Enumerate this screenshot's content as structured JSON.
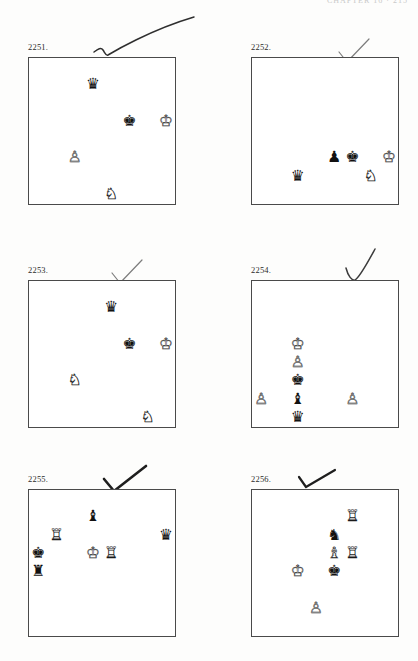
{
  "page": {
    "header_text": "CHAPTER 16  ·  215",
    "background_color": "#fdfdfc",
    "board_border_color": "#4a4a4a",
    "dark_square_color": "#8a8a8a",
    "light_square_color": "#ffffff"
  },
  "glyphs": {
    "white_king": "♔",
    "white_queen": "♕",
    "white_rook": "♖",
    "white_bishop": "♗",
    "white_knight": "♘",
    "white_pawn": "♙",
    "black_king": "♚",
    "black_queen": "♛",
    "black_rook": "♜",
    "black_bishop": "♝",
    "black_knight": "♞",
    "black_pawn": "♟"
  },
  "puzzles": [
    {
      "number": "2251.",
      "x": 28,
      "y": 42,
      "marked": true,
      "mark_style": "long-check",
      "pieces": [
        {
          "square": "d7",
          "piece": "black_queen",
          "color": "b"
        },
        {
          "square": "f5",
          "piece": "black_king",
          "color": "b"
        },
        {
          "square": "h5",
          "piece": "white_king",
          "color": "w"
        },
        {
          "square": "c3",
          "piece": "white_pawn",
          "color": "w"
        },
        {
          "square": "e1",
          "piece": "white_knight",
          "color": "w"
        }
      ]
    },
    {
      "number": "2252.",
      "x": 251,
      "y": 42,
      "marked": true,
      "mark_style": "light-check",
      "pieces": [
        {
          "square": "e3",
          "piece": "black_pawn",
          "color": "b"
        },
        {
          "square": "f3",
          "piece": "black_king",
          "color": "b"
        },
        {
          "square": "h3",
          "piece": "white_king",
          "color": "w"
        },
        {
          "square": "c2",
          "piece": "black_queen",
          "color": "b"
        },
        {
          "square": "g2",
          "piece": "white_knight",
          "color": "w"
        }
      ]
    },
    {
      "number": "2253.",
      "x": 28,
      "y": 265,
      "marked": true,
      "mark_style": "light-check",
      "pieces": [
        {
          "square": "e7",
          "piece": "black_queen",
          "color": "b"
        },
        {
          "square": "f5",
          "piece": "black_king",
          "color": "b"
        },
        {
          "square": "h5",
          "piece": "white_king",
          "color": "w"
        },
        {
          "square": "c3",
          "piece": "white_knight",
          "color": "w"
        },
        {
          "square": "g1",
          "piece": "white_knight",
          "color": "w"
        }
      ]
    },
    {
      "number": "2254.",
      "x": 251,
      "y": 265,
      "marked": true,
      "mark_style": "tall-check",
      "pieces": [
        {
          "square": "c5",
          "piece": "white_king",
          "color": "w"
        },
        {
          "square": "c4",
          "piece": "white_pawn",
          "color": "w"
        },
        {
          "square": "c3",
          "piece": "black_king",
          "color": "b"
        },
        {
          "square": "a2",
          "piece": "white_pawn",
          "color": "w"
        },
        {
          "square": "c2",
          "piece": "black_bishop",
          "color": "b"
        },
        {
          "square": "f2",
          "piece": "white_pawn",
          "color": "w"
        },
        {
          "square": "c1",
          "piece": "black_queen",
          "color": "b"
        }
      ]
    },
    {
      "number": "2255.",
      "x": 28,
      "y": 474,
      "marked": true,
      "mark_style": "bold-check",
      "pieces": [
        {
          "square": "d7",
          "piece": "black_bishop",
          "color": "b"
        },
        {
          "square": "b6",
          "piece": "white_rook",
          "color": "w"
        },
        {
          "square": "h6",
          "piece": "black_queen",
          "color": "b"
        },
        {
          "square": "a5",
          "piece": "black_king",
          "color": "b"
        },
        {
          "square": "d5",
          "piece": "white_king",
          "color": "w"
        },
        {
          "square": "e5",
          "piece": "white_rook",
          "color": "w"
        },
        {
          "square": "a4",
          "piece": "black_rook",
          "color": "b"
        }
      ]
    },
    {
      "number": "2256.",
      "x": 251,
      "y": 474,
      "marked": true,
      "mark_style": "small-check",
      "pieces": [
        {
          "square": "f7",
          "piece": "white_rook",
          "color": "w"
        },
        {
          "square": "e6",
          "piece": "black_knight",
          "color": "b"
        },
        {
          "square": "e5",
          "piece": "white_bishop",
          "color": "w"
        },
        {
          "square": "f5",
          "piece": "white_rook",
          "color": "w"
        },
        {
          "square": "c4",
          "piece": "white_king",
          "color": "w"
        },
        {
          "square": "e4",
          "piece": "black_king",
          "color": "b"
        },
        {
          "square": "d2",
          "piece": "white_pawn",
          "color": "w"
        }
      ]
    }
  ]
}
